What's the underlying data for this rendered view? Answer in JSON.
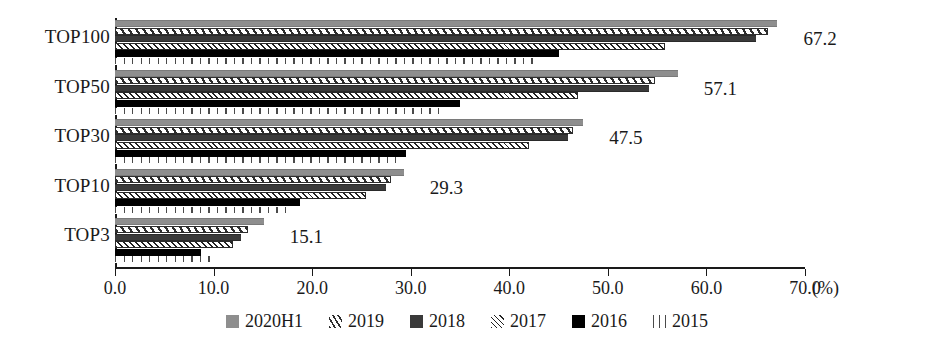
{
  "chart_data": {
    "type": "bar",
    "orientation": "horizontal",
    "title": "",
    "xlabel": "(%)",
    "ylabel": "",
    "xlim": [
      0.0,
      70.0
    ],
    "xticks": [
      "0.0",
      "10.0",
      "20.0",
      "30.0",
      "40.0",
      "50.0",
      "60.0",
      "70.0"
    ],
    "xtick_values": [
      0,
      10,
      20,
      30,
      40,
      50,
      60,
      70
    ],
    "grid": false,
    "legend_position": "bottom-center",
    "categories": [
      "TOP100",
      "TOP50",
      "TOP30",
      "TOP10",
      "TOP3"
    ],
    "series": [
      {
        "name": "2020H1",
        "pattern": "solid-gray",
        "color": "#8e8e8e",
        "values": [
          67.2,
          57.1,
          47.5,
          29.3,
          15.1
        ]
      },
      {
        "name": "2019",
        "pattern": "diagonal-hatch",
        "color": "#2e2e2e",
        "values": [
          66.2,
          54.8,
          46.5,
          28.0,
          13.5
        ]
      },
      {
        "name": "2018",
        "pattern": "solid-dark-gray",
        "color": "#3a3a3a",
        "values": [
          65.0,
          54.2,
          46.0,
          27.5,
          12.8
        ]
      },
      {
        "name": "2017",
        "pattern": "cross-hatch",
        "color": "#222222",
        "values": [
          55.8,
          47.0,
          42.0,
          25.5,
          12.0
        ]
      },
      {
        "name": "2016",
        "pattern": "solid-black",
        "color": "#000000",
        "values": [
          45.0,
          35.0,
          29.5,
          18.8,
          8.7
        ]
      },
      {
        "name": "2015",
        "pattern": "vertical-lines",
        "color": "#4a4a4a",
        "values": [
          43.0,
          33.5,
          28.5,
          18.0,
          10.3
        ]
      }
    ],
    "data_labels": [
      {
        "category": "TOP100",
        "text": "67.2"
      },
      {
        "category": "TOP50",
        "text": "57.1"
      },
      {
        "category": "TOP30",
        "text": "47.5"
      },
      {
        "category": "TOP10",
        "text": "29.3"
      },
      {
        "category": "TOP3",
        "text": "15.1"
      }
    ]
  },
  "legend": {
    "items": [
      {
        "label": "2020H1",
        "swatch": "swatch-2020h1-icon"
      },
      {
        "label": "2019",
        "swatch": "swatch-2019-icon"
      },
      {
        "label": "2018",
        "swatch": "swatch-2018-icon"
      },
      {
        "label": "2017",
        "swatch": "swatch-2017-icon"
      },
      {
        "label": "2016",
        "swatch": "swatch-2016-icon"
      },
      {
        "label": "2015",
        "swatch": "swatch-2015-icon"
      }
    ]
  },
  "axis": {
    "unit": "(%)"
  }
}
